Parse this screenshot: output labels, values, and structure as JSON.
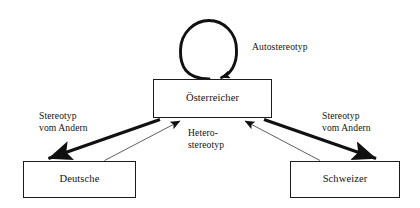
{
  "diagram": {
    "title_text": "",
    "background_color": "#ffffff",
    "stroke_color": "#1b1b1b",
    "nodes": [
      {
        "id": "oesterreicher",
        "label": "Österreicher"
      },
      {
        "id": "deutsche",
        "label": "Deutsche"
      },
      {
        "id": "schweizer",
        "label": "Schweizer"
      }
    ],
    "labels": {
      "autostereotyp": "Autostereotyp",
      "stereotyp_left_line1": "Stereotyp",
      "stereotyp_left_line2": "vom Andern",
      "stereotyp_right_line1": "Stereotyp",
      "stereotyp_right_line2": "vom Andern",
      "hetero_line1": "Hetero-",
      "hetero_line2": "stereotyp"
    },
    "edges": [
      {
        "id": "self-loop",
        "from": "oesterreicher",
        "to": "oesterreicher",
        "style": "thick",
        "shape": "loop",
        "label": "Autostereotyp"
      },
      {
        "id": "oesterreicher-to-deutsche",
        "from": "oesterreicher",
        "to": "deutsche",
        "style": "thick",
        "shape": "straight",
        "label": "Stereotyp vom Andern"
      },
      {
        "id": "oesterreicher-to-schweizer",
        "from": "oesterreicher",
        "to": "schweizer",
        "style": "thick",
        "shape": "straight",
        "label": "Stereotyp vom Andern"
      },
      {
        "id": "deutsche-to-oesterreicher",
        "from": "deutsche",
        "to": "oesterreicher",
        "style": "thin",
        "shape": "straight",
        "label": "Heterostereotyp"
      },
      {
        "id": "schweizer-to-oesterreicher",
        "from": "schweizer",
        "to": "oesterreicher",
        "style": "thin",
        "shape": "straight",
        "label": "Heterostereotyp"
      }
    ]
  }
}
